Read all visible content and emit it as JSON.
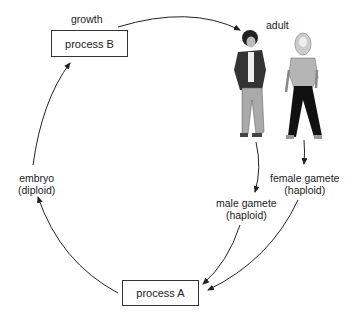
{
  "diagram": {
    "title": "",
    "nodes": {
      "process_b": {
        "label": "process B"
      },
      "process_a": {
        "label": "process A"
      },
      "growth": {
        "label": "growth"
      },
      "adult": {
        "label": "adult"
      },
      "male_gamete": {
        "line1": "male gamete",
        "line2": "(haploid)"
      },
      "female_gamete": {
        "line1": "female gamete",
        "line2": "(haploid)"
      },
      "embryo": {
        "line1": "embryo",
        "line2": "(diploid)"
      }
    },
    "edges": [
      {
        "from": "process B",
        "to": "adult",
        "label": "growth"
      },
      {
        "from": "adult (male)",
        "to": "male gamete"
      },
      {
        "from": "adult (female)",
        "to": "female gamete"
      },
      {
        "from": "male gamete",
        "to": "process A"
      },
      {
        "from": "female gamete",
        "to": "process A"
      },
      {
        "from": "process A",
        "to": "embryo"
      },
      {
        "from": "embryo",
        "to": "process B"
      }
    ],
    "colors": {
      "line": "#222222",
      "box_border": "#333333",
      "background": "#ffffff"
    }
  }
}
